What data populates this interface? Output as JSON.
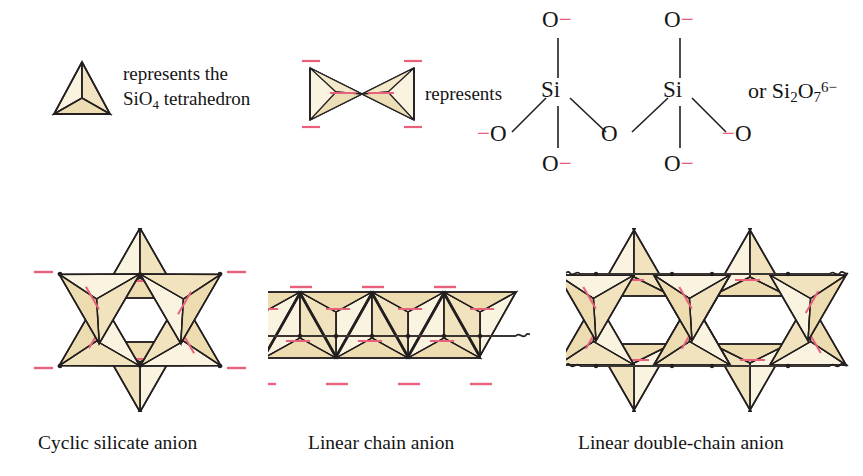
{
  "figure": {
    "title_caption_row": [
      "Cyclic silicate anion",
      "Linear chain anion",
      "Linear double-chain anion"
    ],
    "legend": {
      "tetrahedron_icon": "tetrahedron-icon",
      "line1": "represents the",
      "line2_prefix": "SiO",
      "line2_sub": "4",
      "line2_suffix": " tetrahedron"
    },
    "bowtie": {
      "icon": "double-tetrahedron-bowtie-icon",
      "represents_label": "represents",
      "charge_labels": [
        "−",
        "−",
        "−",
        "−"
      ]
    },
    "lewis": {
      "si_left": "Si",
      "si_right": "Si",
      "o_top_left": "O",
      "o_top_right": "O",
      "o_bottom_left": "O",
      "o_bottom_right": "O",
      "o_bridge": "O",
      "o_side_left": "O",
      "o_side_right": "O",
      "minus": "−",
      "or_label": "or",
      "formula_main": "Si",
      "formula_sub1": "2",
      "formula_o": "O",
      "formula_sub2": "7",
      "formula_charge": "6−"
    },
    "structures": {
      "cyclic": {
        "name": "Cyclic silicate anion",
        "tetrahedra_count": 6,
        "charge_marks": 6,
        "caption": "Cyclic silicate anion"
      },
      "linear_chain": {
        "name": "Linear chain anion",
        "tetrahedra_count": 7,
        "caption": "Linear chain anion",
        "chain_ends": "squiggle"
      },
      "double_chain": {
        "name": "Linear double-chain anion",
        "caption": "Linear double-chain anion",
        "chain_ends": "squiggle"
      }
    },
    "colors": {
      "tetra_fill_light": "#faf2de",
      "tetra_fill_mid": "#f3e6c6",
      "tetra_fill_dark": "#eadcb4",
      "outline": "#231f20",
      "negative_charge": "#e8607a",
      "background": "#ffffff"
    }
  }
}
